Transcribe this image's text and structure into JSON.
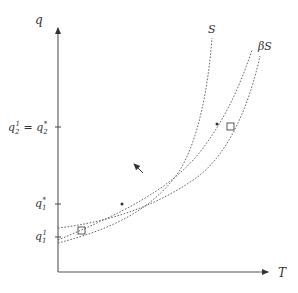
{
  "diagram": {
    "axes": {
      "x_label": "T",
      "y_label": "q"
    },
    "y_ticks": [
      {
        "label_main": "q",
        "label_sub": "2",
        "label_sup": "1",
        "eq": " = ",
        "label2_main": "q",
        "label2_sub": "2",
        "label2_sup": "*",
        "y": 127
      },
      {
        "label_main": "q",
        "label_sub": "1",
        "label_sup": "*",
        "y": 203
      },
      {
        "label_main": "q",
        "label_sub": "1",
        "label_sup": "1",
        "y": 236
      }
    ],
    "curves": [
      {
        "name": "S",
        "label": "S"
      },
      {
        "name": "middle",
        "label": ""
      },
      {
        "name": "betaS",
        "label": "βS"
      }
    ],
    "markers": {
      "dots": [
        {
          "x": 122,
          "y": 204
        },
        {
          "x": 217,
          "y": 124
        }
      ],
      "squares": [
        {
          "x": 82,
          "y": 230
        },
        {
          "x": 231,
          "y": 127
        }
      ]
    },
    "direction_arrow": {
      "from": [
        143,
        173
      ],
      "to": [
        133,
        163
      ]
    },
    "colors": {
      "ink": "#555555",
      "label": "#333333"
    }
  }
}
